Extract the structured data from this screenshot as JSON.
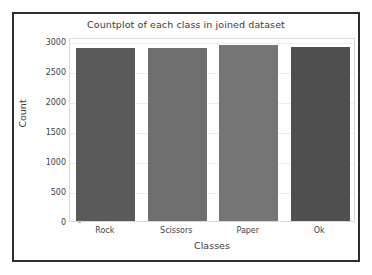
{
  "figure": {
    "title": "Countplot of each class in joined dataset",
    "xlabel": "Classes",
    "ylabel": "Count",
    "border_color": "#2e2e2e",
    "background": "#ffffff"
  },
  "chart_data": {
    "type": "bar",
    "title": "Countplot of each class in joined dataset",
    "xlabel": "Classes",
    "ylabel": "Count",
    "categories": [
      "Rock",
      "Scissors",
      "Paper",
      "Ok"
    ],
    "values": [
      2880,
      2880,
      2920,
      2890
    ],
    "colors": [
      "#5a5a5a",
      "#6e6e6e",
      "#757575",
      "#4f4f4f"
    ],
    "ylim": [
      0,
      3060
    ],
    "yticks": [
      0,
      500,
      1000,
      1500,
      2000,
      2500,
      3000
    ],
    "ytick_labels": [
      "0",
      "500",
      "1000",
      "1500",
      "2000",
      "2500",
      "3000"
    ],
    "grid": true,
    "legend": null
  }
}
